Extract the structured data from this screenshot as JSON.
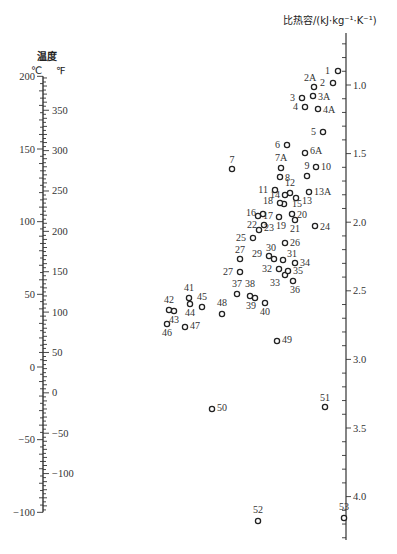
{
  "chart_data": {
    "type": "nomogram",
    "left_axis": {
      "title": "温度",
      "unit_left": "℃",
      "unit_right": "℉",
      "celsius_ticks": [
        200,
        150,
        100,
        50,
        0,
        -50,
        -100
      ],
      "fahrenheit_ticks": [
        350,
        300,
        250,
        200,
        150,
        100,
        50,
        0,
        -50,
        -100
      ],
      "celsius_range": [
        -100,
        200
      ]
    },
    "right_axis": {
      "title": "比热容/(kJ·kg⁻¹·K⁻¹)",
      "ticks": [
        "1.0",
        "1.5",
        "2.0",
        "2.5",
        "3.0",
        "3.5",
        "4.0"
      ],
      "range": [
        0.6,
        4.2
      ]
    },
    "points": [
      {
        "id": "1",
        "x": 338,
        "y": 71
      },
      {
        "id": "2",
        "x": 333,
        "y": 83
      },
      {
        "id": "2A",
        "x": 314,
        "y": 87
      },
      {
        "id": "3",
        "x": 302,
        "y": 98
      },
      {
        "id": "3A",
        "x": 313,
        "y": 96
      },
      {
        "id": "4",
        "x": 305,
        "y": 107
      },
      {
        "id": "4A",
        "x": 318,
        "y": 109
      },
      {
        "id": "5",
        "x": 323,
        "y": 132
      },
      {
        "id": "6",
        "x": 287,
        "y": 145
      },
      {
        "id": "6A",
        "x": 305,
        "y": 153
      },
      {
        "id": "7",
        "x": 232,
        "y": 169
      },
      {
        "id": "7A",
        "x": 281,
        "y": 168
      },
      {
        "id": "8",
        "x": 280,
        "y": 177
      },
      {
        "id": "9",
        "x": 307,
        "y": 176
      },
      {
        "id": "10",
        "x": 316,
        "y": 167
      },
      {
        "id": "11",
        "x": 275,
        "y": 190
      },
      {
        "id": "12",
        "x": 290,
        "y": 193
      },
      {
        "id": "13",
        "x": 296,
        "y": 198
      },
      {
        "id": "13A",
        "x": 309,
        "y": 192
      },
      {
        "id": "14",
        "x": 285,
        "y": 195
      },
      {
        "id": "15",
        "x": 284,
        "y": 204
      },
      {
        "id": "18",
        "x": 280,
        "y": 203
      },
      {
        "id": "16",
        "x": 263,
        "y": 214
      },
      {
        "id": "17",
        "x": 258,
        "y": 216
      },
      {
        "id": "19",
        "x": 279,
        "y": 217
      },
      {
        "id": "20",
        "x": 292,
        "y": 214
      },
      {
        "id": "21",
        "x": 295,
        "y": 220
      },
      {
        "id": "22",
        "x": 264,
        "y": 225
      },
      {
        "id": "23",
        "x": 259,
        "y": 230
      },
      {
        "id": "24",
        "x": 315,
        "y": 226
      },
      {
        "id": "25",
        "x": 253,
        "y": 238
      },
      {
        "id": "26",
        "x": 285,
        "y": 243
      },
      {
        "id": "27",
        "x": 240,
        "y": 259
      },
      {
        "id": "27A",
        "x": 240,
        "y": 272
      },
      {
        "id": "29",
        "x": 269,
        "y": 256
      },
      {
        "id": "30",
        "x": 274,
        "y": 259
      },
      {
        "id": "31",
        "x": 283,
        "y": 260
      },
      {
        "id": "32",
        "x": 279,
        "y": 269
      },
      {
        "id": "33",
        "x": 285,
        "y": 275
      },
      {
        "id": "34",
        "x": 295,
        "y": 263
      },
      {
        "id": "35",
        "x": 288,
        "y": 271
      },
      {
        "id": "36",
        "x": 293,
        "y": 281
      },
      {
        "id": "37",
        "x": 237,
        "y": 294
      },
      {
        "id": "38",
        "x": 250,
        "y": 296
      },
      {
        "id": "39",
        "x": 255,
        "y": 298
      },
      {
        "id": "40",
        "x": 265,
        "y": 303
      },
      {
        "id": "41",
        "x": 189,
        "y": 298
      },
      {
        "id": "42",
        "x": 169,
        "y": 310
      },
      {
        "id": "43",
        "x": 174,
        "y": 311
      },
      {
        "id": "44",
        "x": 190,
        "y": 304
      },
      {
        "id": "45",
        "x": 202,
        "y": 307
      },
      {
        "id": "46",
        "x": 167,
        "y": 324
      },
      {
        "id": "47",
        "x": 185,
        "y": 327
      },
      {
        "id": "48",
        "x": 222,
        "y": 314
      },
      {
        "id": "49",
        "x": 277,
        "y": 341
      },
      {
        "id": "50",
        "x": 212,
        "y": 409
      },
      {
        "id": "51",
        "x": 325,
        "y": 407
      },
      {
        "id": "52",
        "x": 258,
        "y": 521
      },
      {
        "id": "53",
        "x": 344,
        "y": 518
      }
    ]
  },
  "labels": {
    "left_title": "温度",
    "unit_c": "℃",
    "unit_f": "℉",
    "right_title": "比热容/(kJ·kg⁻¹·K⁻¹)"
  }
}
